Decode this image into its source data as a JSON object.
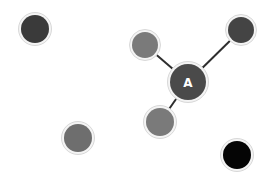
{
  "diagram": {
    "background": "#ffffff",
    "edge_color": "#2e2e2e",
    "node_border": "#e6e6e6",
    "nodes": [
      {
        "id": "n1",
        "label": "",
        "cx": 35,
        "cy": 29,
        "r": 14,
        "fill": "#3a3a3a"
      },
      {
        "id": "n2",
        "label": "",
        "cx": 145,
        "cy": 45,
        "r": 13,
        "fill": "#7a7a7a"
      },
      {
        "id": "n3",
        "label": "",
        "cx": 241,
        "cy": 30,
        "r": 13,
        "fill": "#444444"
      },
      {
        "id": "A",
        "label": "A",
        "cx": 188,
        "cy": 82,
        "r": 18,
        "fill": "#4a4a4a"
      },
      {
        "id": "n5",
        "label": "",
        "cx": 160,
        "cy": 122,
        "r": 14,
        "fill": "#7a7a7a"
      },
      {
        "id": "n6",
        "label": "",
        "cx": 78,
        "cy": 138,
        "r": 14,
        "fill": "#6e6e6e"
      },
      {
        "id": "n7",
        "label": "",
        "cx": 237,
        "cy": 155,
        "r": 14,
        "fill": "#050505"
      }
    ],
    "edges": [
      {
        "from": "A",
        "to": "n2"
      },
      {
        "from": "A",
        "to": "n3"
      },
      {
        "from": "A",
        "to": "n5"
      }
    ]
  }
}
